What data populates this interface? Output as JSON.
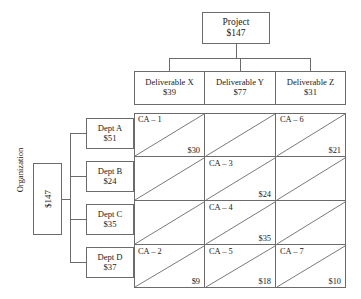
{
  "project": {
    "name": "Project",
    "amount": "$147"
  },
  "deliverables": [
    {
      "name": "Deliverable X",
      "amount": "$39"
    },
    {
      "name": "Deliverable Y",
      "amount": "$77"
    },
    {
      "name": "Deliverable Z",
      "amount": "$31"
    }
  ],
  "organization": {
    "label": "Organization",
    "amount": "$147",
    "departments": [
      {
        "name": "Dept A",
        "amount": "$51"
      },
      {
        "name": "Dept B",
        "amount": "$24"
      },
      {
        "name": "Dept C",
        "amount": "$35"
      },
      {
        "name": "Dept D",
        "amount": "$37"
      }
    ]
  },
  "matrix": {
    "row_headers": [
      "Dept A",
      "Dept B",
      "Dept C",
      "Dept D"
    ],
    "column_headers": [
      "Deliverable X",
      "Deliverable Y",
      "Deliverable Z"
    ],
    "cells": [
      [
        {
          "id": "CA – 1",
          "amount": "$30"
        },
        {
          "id": "",
          "amount": ""
        },
        {
          "id": "CA – 6",
          "amount": "$21"
        }
      ],
      [
        {
          "id": "",
          "amount": ""
        },
        {
          "id": "CA – 3",
          "amount": "$24"
        },
        {
          "id": "",
          "amount": ""
        }
      ],
      [
        {
          "id": "",
          "amount": ""
        },
        {
          "id": "CA – 4",
          "amount": "$35"
        },
        {
          "id": "",
          "amount": ""
        }
      ],
      [
        {
          "id": "CA – 2",
          "amount": "$9"
        },
        {
          "id": "CA – 5",
          "amount": "$18"
        },
        {
          "id": "CA – 7",
          "amount": "$10"
        }
      ]
    ]
  },
  "style": {
    "line_color": "#6b6b6b",
    "text_color": "#1a1a1a",
    "background": "#ffffff"
  }
}
